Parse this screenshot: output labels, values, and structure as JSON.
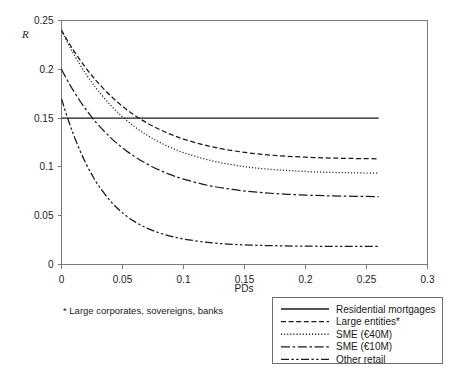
{
  "chart_data": {
    "type": "line",
    "title": "",
    "xlabel": "PDs",
    "ylabel": "R",
    "xlim": [
      0,
      0.3
    ],
    "ylim": [
      0,
      0.25
    ],
    "xticks": [
      "0",
      "0.05",
      "0.1",
      "0.15",
      "0.2",
      "0.25",
      "0.3"
    ],
    "xtick_values": [
      0,
      0.05,
      0.1,
      0.15,
      0.2,
      0.25,
      0.3
    ],
    "yticks": [
      "0",
      "0.05",
      "0.1",
      "0.15",
      "0.2",
      "0.25"
    ],
    "ytick_values": [
      0,
      0.05,
      0.1,
      0.15,
      0.2,
      0.25
    ],
    "grid": false,
    "legend_position": "bottom-right",
    "x": [
      0,
      0.0025,
      0.005,
      0.0075,
      0.01,
      0.015,
      0.02,
      0.025,
      0.03,
      0.04,
      0.05,
      0.06,
      0.07,
      0.08,
      0.09,
      0.1,
      0.12,
      0.14,
      0.16,
      0.18,
      0.2,
      0.22,
      0.24,
      0.26
    ],
    "series": [
      {
        "name": "Residential mortgages",
        "style": "solid",
        "values": [
          0.15,
          0.15,
          0.15,
          0.15,
          0.15,
          0.15,
          0.15,
          0.15,
          0.15,
          0.15,
          0.15,
          0.15,
          0.15,
          0.15,
          0.15,
          0.15,
          0.15,
          0.15,
          0.15,
          0.15,
          0.15,
          0.15,
          0.15,
          0.15
        ],
        "asymptote": 0.15,
        "start": 0.15
      },
      {
        "name": "Large entities*",
        "style": "dashed",
        "values": [
          0.24,
          0.2345,
          0.2292,
          0.2241,
          0.2192,
          0.2099,
          0.2013,
          0.1934,
          0.1861,
          0.1731,
          0.1621,
          0.1529,
          0.1451,
          0.1386,
          0.1331,
          0.1285,
          0.1215,
          0.1167,
          0.1134,
          0.1113,
          0.1099,
          0.1091,
          0.1086,
          0.1083
        ],
        "asymptote": 0.12,
        "start": 0.24
      },
      {
        "name": "SME (€40M)",
        "style": "dotted",
        "values": [
          0.24,
          0.2335,
          0.2273,
          0.2214,
          0.2157,
          0.205,
          0.1952,
          0.1862,
          0.178,
          0.1635,
          0.1513,
          0.1411,
          0.1326,
          0.1255,
          0.1196,
          0.1146,
          0.1072,
          0.1022,
          0.0988,
          0.0967,
          0.0953,
          0.0944,
          0.0939,
          0.0936
        ],
        "asymptote": 0.112,
        "start": 0.24
      },
      {
        "name": "SME (€10M)",
        "style": "dashdot",
        "values": [
          0.2,
          0.194,
          0.1883,
          0.1828,
          0.1776,
          0.1678,
          0.1589,
          0.1507,
          0.1433,
          0.1303,
          0.1195,
          0.1105,
          0.1031,
          0.0969,
          0.0918,
          0.0875,
          0.0811,
          0.0769,
          0.0741,
          0.0723,
          0.0711,
          0.0703,
          0.0699,
          0.0696
        ],
        "asymptote": 0.085,
        "start": 0.2
      },
      {
        "name": "Other retail",
        "style": "dashdotdot",
        "values": [
          0.17,
          0.1597,
          0.1501,
          0.141,
          0.1325,
          0.1171,
          0.1036,
          0.0918,
          0.0815,
          0.0651,
          0.0529,
          0.0439,
          0.0373,
          0.0324,
          0.0288,
          0.0261,
          0.0226,
          0.0207,
          0.0197,
          0.0191,
          0.0188,
          0.0186,
          0.0185,
          0.0185
        ],
        "asymptote": 0.022,
        "start": 0.17
      }
    ],
    "footnote": "* Large corporates, sovereigns, banks"
  },
  "axes": {
    "y_title": "R",
    "x_title": "PDs"
  },
  "legend": {
    "items": [
      {
        "label": "Residential mortgages",
        "style": "solid"
      },
      {
        "label": "Large entities*",
        "style": "dashed"
      },
      {
        "label": "SME (€40M)",
        "style": "dotted"
      },
      {
        "label": "SME (€10M)",
        "style": "dashdot"
      },
      {
        "label": "Other retail",
        "style": "dashdotdot"
      }
    ]
  },
  "footnote": {
    "text": "* Large corporates, sovereigns, banks"
  }
}
